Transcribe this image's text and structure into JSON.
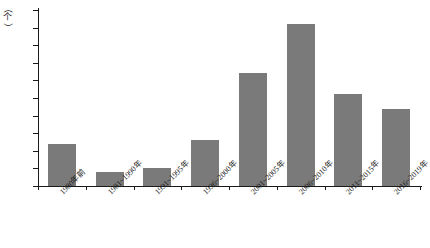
{
  "chart_data": {
    "type": "bar",
    "title": "",
    "xlabel": "",
    "ylabel": "（个）",
    "ylim": [
      0,
      50
    ],
    "yticks": [
      0,
      5,
      10,
      15,
      20,
      25,
      30,
      35,
      40,
      45,
      50
    ],
    "grid": false,
    "legend": null,
    "bar_color": "#7a7a7a",
    "axis_color": "#1a1a1a",
    "categories": [
      "1980年前",
      "1981~1990年",
      "1991~1995年",
      "1996~2000年",
      "2001~2005年",
      "2006~2010年",
      "2011~2015年",
      "2016~2019年"
    ],
    "values": [
      12,
      4,
      5,
      13,
      32,
      46,
      26,
      22
    ]
  },
  "y_unit": {
    "open_paren": "（",
    "text": "个",
    "close_paren": "）"
  },
  "caption": ""
}
